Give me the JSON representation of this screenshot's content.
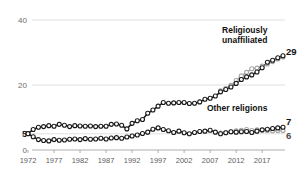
{
  "chart_data": {
    "type": "line",
    "title": "",
    "subtitle": "",
    "xlabel": "",
    "ylabel": "",
    "ylim": [
      0,
      40
    ],
    "xlim": [
      1972,
      2021
    ],
    "grid": true,
    "legend_position": "inline-annotation",
    "y_ticks": [
      {
        "value": 40,
        "label": "40",
        "bold": false
      },
      {
        "value": 20,
        "label": "20",
        "bold": false
      },
      {
        "value": 5,
        "label": "5",
        "bold": true
      },
      {
        "value": 0,
        "label": "0",
        "bold": false
      }
    ],
    "x_ticks": [
      {
        "value": 1972,
        "label": "1972"
      },
      {
        "value": 1977,
        "label": "1977"
      },
      {
        "value": 1982,
        "label": "1982"
      },
      {
        "value": 1987,
        "label": "1987"
      },
      {
        "value": 1992,
        "label": "1992"
      },
      {
        "value": 1997,
        "label": "1997"
      },
      {
        "value": 2002,
        "label": "2002"
      },
      {
        "value": 2007,
        "label": "2007"
      },
      {
        "value": 2012,
        "label": "2012"
      },
      {
        "value": 2017,
        "label": "2017"
      }
    ],
    "annotations": [
      {
        "id": "unaffiliated",
        "text": "Religiously\nunaffiliated",
        "lines": [
          "Religiously",
          "unaffiliated"
        ],
        "x": 2018,
        "y": 36
      },
      {
        "id": "other",
        "text": "Other religions",
        "lines": [
          "Other religions"
        ],
        "x": 2018,
        "y": 12
      }
    ],
    "end_labels": [
      {
        "series": "unaffiliated_dark",
        "label": "29",
        "value": 29,
        "color": "#111111"
      },
      {
        "series": "other_dark",
        "label": "7",
        "value": 7,
        "color": "#111111"
      },
      {
        "series": "other_light",
        "label": "6",
        "value": 6,
        "color": "#4a4a4a"
      }
    ],
    "start_label": {
      "label": "5",
      "value": 5,
      "color": "#1a1a1a"
    },
    "colors": {
      "dark": "#1a1a1a",
      "light": "#a5a5a5",
      "grid": "#d8d8d8",
      "axis": "#9a9a9a",
      "background": "#ffffff"
    },
    "x": [
      1972,
      1973,
      1974,
      1975,
      1976,
      1977,
      1978,
      1979,
      1980,
      1981,
      1982,
      1983,
      1984,
      1985,
      1986,
      1987,
      1988,
      1989,
      1990,
      1991,
      1992,
      1993,
      1994,
      1995,
      1996,
      1997,
      1998,
      1999,
      2000,
      2001,
      2002,
      2003,
      2004,
      2005,
      2006,
      2007,
      2008,
      2009,
      2010,
      2011,
      2012,
      2013,
      2014,
      2015,
      2016,
      2017,
      2018,
      2019,
      2020,
      2021
    ],
    "series": [
      {
        "name": "Religiously unaffiliated (series A)",
        "key": "unaffiliated_dark",
        "color": "#1a1a1a",
        "style": "dark",
        "values": [
          5.1,
          6.3,
          7.0,
          7.2,
          7.5,
          7.3,
          7.9,
          7.6,
          7.2,
          7.5,
          7.4,
          7.3,
          7.4,
          7.2,
          7.3,
          7.3,
          7.9,
          8.0,
          7.6,
          6.5,
          8.2,
          9.0,
          9.4,
          11.3,
          12.3,
          13.5,
          14.6,
          14.4,
          14.5,
          14.6,
          14.6,
          14.3,
          14.4,
          14.8,
          15.6,
          15.9,
          16.6,
          17.9,
          18.6,
          19.4,
          20.5,
          21.7,
          22.5,
          23.1,
          24.0,
          25.3,
          27.0,
          27.6,
          28.4,
          29.0
        ]
      },
      {
        "name": "Religiously unaffiliated (series B)",
        "key": "unaffiliated_light",
        "color": "#a5a5a5",
        "style": "light",
        "values": [
          null,
          null,
          null,
          null,
          null,
          null,
          null,
          null,
          null,
          null,
          null,
          null,
          null,
          null,
          null,
          null,
          null,
          null,
          null,
          null,
          null,
          null,
          null,
          null,
          null,
          null,
          null,
          null,
          null,
          null,
          null,
          null,
          null,
          null,
          null,
          null,
          null,
          18.2,
          18.9,
          19.9,
          21.4,
          22.8,
          23.9,
          25.0,
          25.2,
          25.8,
          26.5,
          27.2,
          28.0,
          28.6
        ]
      },
      {
        "name": "Other religions (series A)",
        "key": "other_dark",
        "color": "#1a1a1a",
        "style": "dark",
        "values": [
          5.0,
          4.1,
          3.2,
          2.9,
          2.8,
          3.2,
          3.0,
          3.1,
          3.3,
          3.4,
          3.2,
          3.5,
          3.3,
          3.4,
          3.6,
          3.4,
          3.7,
          3.8,
          3.6,
          4.0,
          4.3,
          4.6,
          5.1,
          5.5,
          6.4,
          6.8,
          6.3,
          5.9,
          5.4,
          5.8,
          5.3,
          5.0,
          5.4,
          5.7,
          5.8,
          6.1,
          5.5,
          5.0,
          5.3,
          5.6,
          5.5,
          5.6,
          5.7,
          5.4,
          5.8,
          6.2,
          6.4,
          6.6,
          6.8,
          7.0
        ]
      },
      {
        "name": "Other religions (series B)",
        "key": "other_light",
        "color": "#a5a5a5",
        "style": "light",
        "values": [
          null,
          null,
          null,
          null,
          null,
          null,
          null,
          null,
          null,
          null,
          null,
          null,
          null,
          null,
          null,
          null,
          null,
          null,
          null,
          null,
          null,
          null,
          null,
          null,
          null,
          null,
          null,
          null,
          null,
          null,
          null,
          null,
          null,
          null,
          null,
          null,
          null,
          5.2,
          5.4,
          5.6,
          5.9,
          6.1,
          6.3,
          6.0,
          6.2,
          6.1,
          6.0,
          5.9,
          6.0,
          6.0
        ]
      }
    ]
  }
}
